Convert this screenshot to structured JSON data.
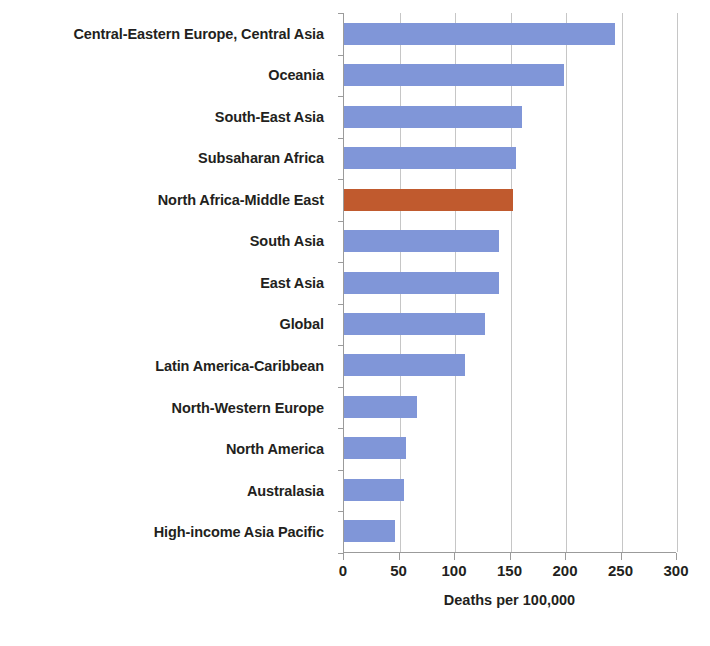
{
  "chart_data": {
    "type": "bar",
    "orientation": "horizontal",
    "title": "",
    "xlabel": "Deaths per 100,000",
    "ylabel": "",
    "xlim": [
      0,
      300
    ],
    "xticks": [
      0,
      50,
      100,
      150,
      200,
      250,
      300
    ],
    "grid": true,
    "legend": false,
    "categories": [
      "Central-Eastern Europe, Central Asia",
      "Oceania",
      "South-East Asia",
      "Subsaharan Africa",
      "North Africa-Middle East",
      "South Asia",
      "East Asia",
      "Global",
      "Latin America-Caribbean",
      "North-Western Europe",
      "North America",
      "Australasia",
      "High-income Asia Pacific"
    ],
    "values": [
      244,
      198,
      160,
      155,
      152,
      140,
      140,
      127,
      109,
      66,
      56,
      54,
      46
    ],
    "highlight_category": "North Africa-Middle East",
    "highlight_index": 4,
    "colors": {
      "bar": "#8096d8",
      "highlight": "#c05a2e",
      "gridline": "#c6c6c6",
      "axis": "#9b9b9b",
      "text": "#231f20"
    }
  }
}
